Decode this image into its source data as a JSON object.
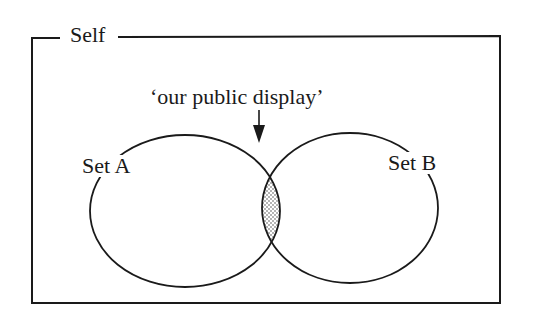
{
  "diagram": {
    "type": "venn",
    "frame_label": "Self",
    "annotation": "‘our public display’",
    "sets": [
      {
        "label": "Set A"
      },
      {
        "label": "Set B"
      }
    ],
    "intersection": {
      "label": "‘our public display’",
      "fill": "stippled"
    },
    "colors": {
      "line": "#1a1a1a",
      "background": "#ffffff",
      "stipple": "#555555"
    }
  }
}
